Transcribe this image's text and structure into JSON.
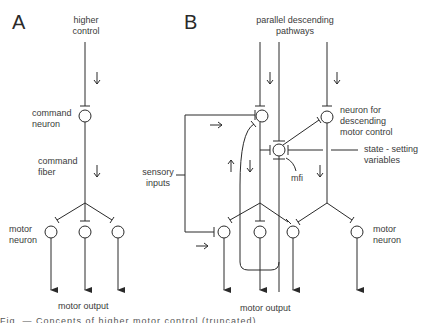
{
  "panels": {
    "A": {
      "label": "A",
      "higher_control": [
        "higher",
        "control"
      ],
      "command_neuron": [
        "command",
        "neuron"
      ],
      "command_fiber": [
        "command",
        "fiber"
      ],
      "motor_neuron": [
        "motor",
        "neuron"
      ],
      "motor_output": "motor output"
    },
    "B": {
      "label": "B",
      "parallel_descending": [
        "parallel descending",
        "pathways"
      ],
      "neuron_for_descending": [
        "neuron for",
        "descending",
        "motor control"
      ],
      "state_setting": [
        "state - setting",
        "variables"
      ],
      "sensory_inputs": [
        "sensory",
        "inputs"
      ],
      "mfi": "mfi",
      "motor_neuron": [
        "motor",
        "neuron"
      ],
      "motor_output": "motor output"
    }
  },
  "caption": "Fig. — Concepts of higher motor control (truncated)",
  "colors": {
    "stroke": "#2a2a2a",
    "text": "#3a3a3a"
  }
}
